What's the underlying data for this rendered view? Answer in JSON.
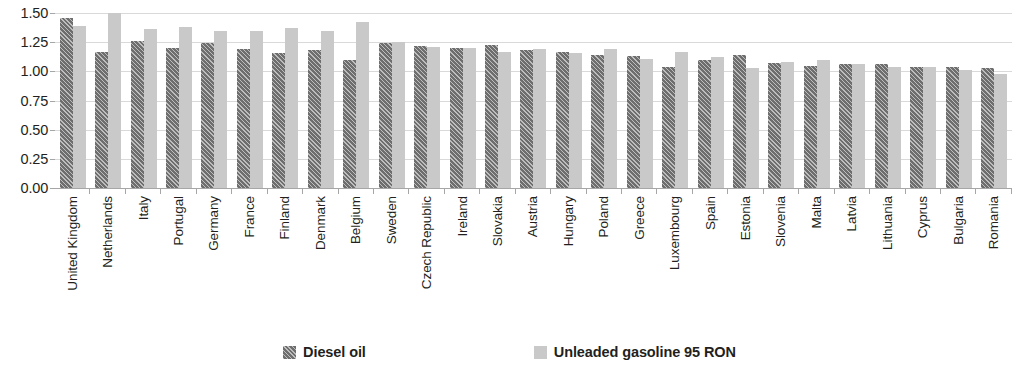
{
  "chart_data": {
    "type": "bar",
    "title": "",
    "subtitle": "",
    "xlabel": "",
    "ylabel": "",
    "ylim": [
      0.0,
      1.5
    ],
    "yticks": [
      "0.00",
      "0.25",
      "0.50",
      "0.75",
      "1.00",
      "1.25",
      "1.50"
    ],
    "ytick_values": [
      0.0,
      0.25,
      0.5,
      0.75,
      1.0,
      1.25,
      1.5
    ],
    "grid": true,
    "legend_position": "bottom",
    "categories": [
      "United Kingdom",
      "Netherlands",
      "Italy",
      "Portugal",
      "Germany",
      "France",
      "Finland",
      "Denmark",
      "Belgium",
      "Sweden",
      "Czech Republic",
      "Ireland",
      "Slovakia",
      "Austria",
      "Hungary",
      "Poland",
      "Greece",
      "Luxembourg",
      "Spain",
      "Estonia",
      "Slovenia",
      "Malta",
      "Latvia",
      "Lithuania",
      "Cyprus",
      "Bulgaria",
      "Romania"
    ],
    "series": [
      {
        "name": "Diesel oil",
        "color": "#6e6e6e",
        "pattern": "diagonal-hatch",
        "values": [
          1.46,
          1.17,
          1.26,
          1.2,
          1.24,
          1.19,
          1.16,
          1.18,
          1.1,
          1.24,
          1.22,
          1.2,
          1.23,
          1.18,
          1.17,
          1.14,
          1.13,
          1.04,
          1.1,
          1.14,
          1.07,
          1.05,
          1.06,
          1.06,
          1.04,
          1.04,
          1.03
        ]
      },
      {
        "name": "Unleaded gasoline 95 RON",
        "color": "#c9c9c9",
        "pattern": "solid",
        "values": [
          1.39,
          1.5,
          1.36,
          1.38,
          1.35,
          1.35,
          1.37,
          1.35,
          1.42,
          1.25,
          1.21,
          1.2,
          1.17,
          1.19,
          1.16,
          1.19,
          1.11,
          1.17,
          1.12,
          1.03,
          1.08,
          1.1,
          1.06,
          1.04,
          1.04,
          1.01,
          0.98
        ]
      }
    ]
  },
  "legend": {
    "items": [
      {
        "label": "Diesel oil",
        "swatch": "diesel-swatch"
      },
      {
        "label": "Unleaded gasoline 95 RON",
        "swatch": "gasoline-swatch"
      }
    ]
  }
}
